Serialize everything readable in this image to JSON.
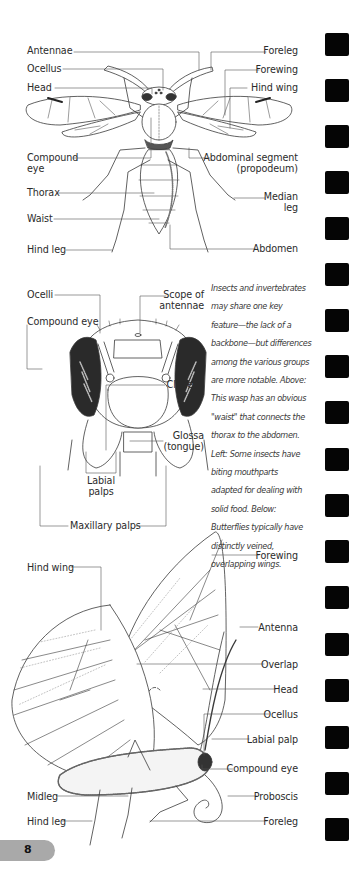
{
  "page": {
    "number": "8",
    "marker_color": "#050505",
    "tab_color": "#a9a9a9",
    "edge_marker_count": 19
  },
  "wasp_diagram": {
    "left_labels": [
      {
        "id": "antennae",
        "text": "Antennae"
      },
      {
        "id": "ocellus",
        "text": "Ocellus"
      },
      {
        "id": "head",
        "text": "Head"
      },
      {
        "id": "compound-eye",
        "lines": [
          "Compound",
          "eye"
        ]
      },
      {
        "id": "thorax",
        "text": "Thorax"
      },
      {
        "id": "waist",
        "text": "Waist"
      },
      {
        "id": "hind-leg",
        "text": "Hind leg"
      }
    ],
    "right_labels": [
      {
        "id": "foreleg",
        "text": "Foreleg"
      },
      {
        "id": "forewing",
        "text": "Forewing"
      },
      {
        "id": "hind-wing",
        "text": "Hind wing"
      },
      {
        "id": "abdominal-segment",
        "lines": [
          "Abdominal segment",
          "(propodeum)"
        ]
      },
      {
        "id": "median-leg",
        "lines": [
          "Median",
          "leg"
        ]
      },
      {
        "id": "abdomen",
        "text": "Abdomen"
      }
    ]
  },
  "head_diagram": {
    "labels": [
      {
        "id": "ocelli",
        "text": "Ocelli"
      },
      {
        "id": "scope-of-antennae",
        "lines": [
          "Scope of",
          "antennae"
        ]
      },
      {
        "id": "compound-eye",
        "text": "Compound eye"
      },
      {
        "id": "clypeus",
        "text": "Clypeus"
      },
      {
        "id": "glossa",
        "lines": [
          "Glossa",
          "(tongue)"
        ]
      },
      {
        "id": "labial-palps",
        "lines": [
          "Labial",
          "palps"
        ]
      },
      {
        "id": "maxillary-palps",
        "text": "Maxillary palps"
      }
    ]
  },
  "caption": {
    "lines": [
      "Insects and invertebrates",
      "may share one key",
      "feature—the lack of a",
      "backbone—but differences",
      "among the various groups",
      "are more notable. Above:",
      "This wasp has an obvious",
      "\"waist\" that connects the",
      "thorax to the abdomen.",
      "Left: Some insects have",
      "biting mouthparts",
      "adapted for dealing with",
      "solid food. Below:",
      "Butterflies typically have",
      "distinctly veined,",
      "overlapping wings."
    ]
  },
  "butterfly_diagram": {
    "left_labels": [
      {
        "id": "hind-wing",
        "text": "Hind wing"
      },
      {
        "id": "midleg",
        "text": "Midleg"
      },
      {
        "id": "hind-leg",
        "text": "Hind leg"
      }
    ],
    "right_labels": [
      {
        "id": "forewing",
        "text": "Forewing"
      },
      {
        "id": "antenna",
        "text": "Antenna"
      },
      {
        "id": "overlap",
        "text": "Overlap"
      },
      {
        "id": "head",
        "text": "Head"
      },
      {
        "id": "ocellus",
        "text": "Ocellus"
      },
      {
        "id": "labial-palp",
        "text": "Labial palp"
      },
      {
        "id": "compound-eye",
        "text": "Compound eye"
      },
      {
        "id": "proboscis",
        "text": "Proboscis"
      },
      {
        "id": "foreleg",
        "text": "Foreleg"
      }
    ]
  }
}
